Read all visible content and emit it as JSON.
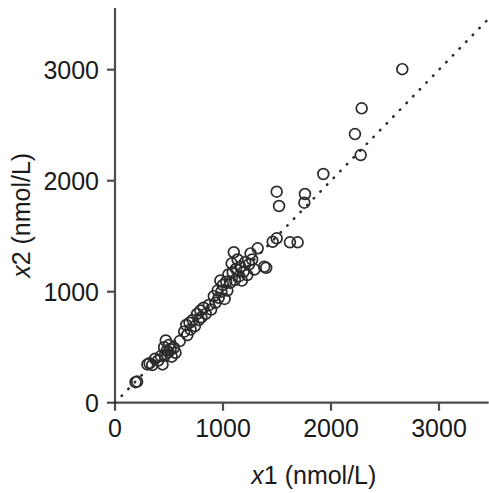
{
  "chart_data": {
    "type": "scatter",
    "title": "",
    "subtitle": "",
    "xlabel": "x1 (nmol/L)",
    "ylabel": "x2 (nmol/L)",
    "xlabel_parts": {
      "italic": "x",
      "rest": "1 (nmol/L)"
    },
    "ylabel_parts": {
      "italic": "x",
      "rest": "2 (nmol/L)"
    },
    "xlim": [
      0,
      3460
    ],
    "ylim": [
      0,
      3540
    ],
    "xticks": [
      0,
      1000,
      2000,
      3000
    ],
    "yticks": [
      0,
      1000,
      2000,
      3000
    ],
    "xtick_labels": [
      "0",
      "1000",
      "2000",
      "3000"
    ],
    "ytick_labels": [
      "0",
      "1000",
      "2000",
      "3000"
    ],
    "grid": false,
    "legend": null,
    "marker_style": "open-circle",
    "marker_color": "#2b2b2b",
    "marker_radius_px": 5.4,
    "reference_line": {
      "name": "identity-line",
      "style": "dotted",
      "slope": 1,
      "intercept": 0,
      "color": "#2b2b2b"
    },
    "points": [
      [
        190,
        185
      ],
      [
        205,
        190
      ],
      [
        300,
        345
      ],
      [
        320,
        355
      ],
      [
        345,
        340
      ],
      [
        370,
        395
      ],
      [
        400,
        380
      ],
      [
        425,
        420
      ],
      [
        440,
        345
      ],
      [
        455,
        500
      ],
      [
        460,
        425
      ],
      [
        470,
        560
      ],
      [
        480,
        470
      ],
      [
        495,
        455
      ],
      [
        500,
        520
      ],
      [
        515,
        480
      ],
      [
        525,
        415
      ],
      [
        545,
        495
      ],
      [
        560,
        450
      ],
      [
        600,
        555
      ],
      [
        640,
        640
      ],
      [
        660,
        700
      ],
      [
        670,
        610
      ],
      [
        690,
        720
      ],
      [
        700,
        660
      ],
      [
        720,
        745
      ],
      [
        740,
        690
      ],
      [
        760,
        800
      ],
      [
        775,
        745
      ],
      [
        790,
        830
      ],
      [
        800,
        770
      ],
      [
        820,
        855
      ],
      [
        840,
        800
      ],
      [
        870,
        880
      ],
      [
        890,
        840
      ],
      [
        915,
        960
      ],
      [
        930,
        900
      ],
      [
        950,
        1010
      ],
      [
        960,
        945
      ],
      [
        975,
        1100
      ],
      [
        985,
        1000
      ],
      [
        1000,
        1060
      ],
      [
        1015,
        935
      ],
      [
        1030,
        1090
      ],
      [
        1040,
        1010
      ],
      [
        1050,
        1155
      ],
      [
        1065,
        1080
      ],
      [
        1080,
        1255
      ],
      [
        1090,
        1175
      ],
      [
        1100,
        1355
      ],
      [
        1110,
        1105
      ],
      [
        1120,
        1205
      ],
      [
        1135,
        1290
      ],
      [
        1150,
        1140
      ],
      [
        1160,
        1225
      ],
      [
        1175,
        1100
      ],
      [
        1190,
        1180
      ],
      [
        1205,
        1265
      ],
      [
        1225,
        1150
      ],
      [
        1241,
        1247
      ],
      [
        1255,
        1345
      ],
      [
        1270,
        1290
      ],
      [
        1290,
        1200
      ],
      [
        1321,
        1391
      ],
      [
        1382,
        1225
      ],
      [
        1400,
        1215
      ],
      [
        1460,
        1450
      ],
      [
        1497,
        1481
      ],
      [
        1497,
        1901
      ],
      [
        1519,
        1772
      ],
      [
        1620,
        1445
      ],
      [
        1691,
        1445
      ],
      [
        1753,
        1802
      ],
      [
        1759,
        1880
      ],
      [
        1929,
        2060
      ],
      [
        2222,
        2420
      ],
      [
        2275,
        2231
      ],
      [
        2284,
        2652
      ],
      [
        2660,
        3005
      ]
    ],
    "n_points": 79
  },
  "figure": {
    "background": "#ffffff",
    "axis_color": "#4d4d4d",
    "text_color": "#1a1a1a"
  }
}
